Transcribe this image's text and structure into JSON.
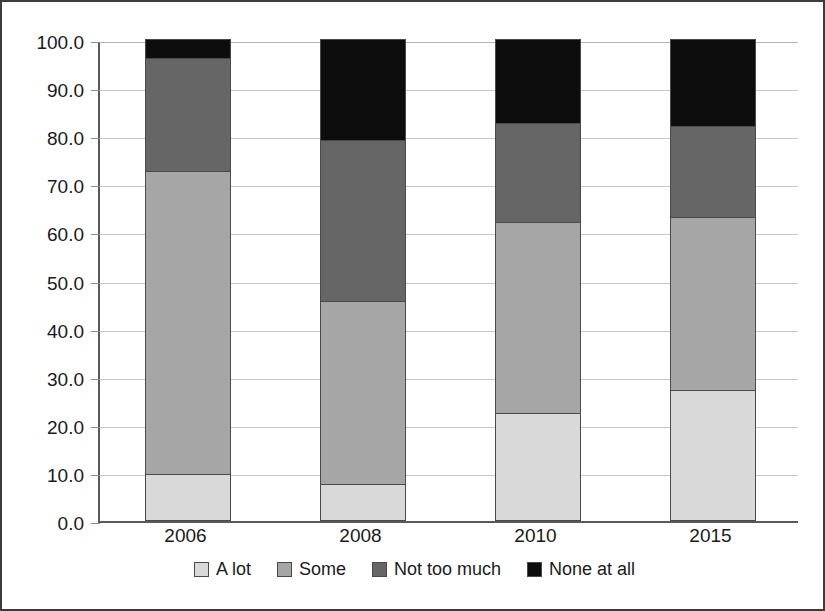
{
  "chart_data": {
    "type": "bar",
    "stacked": true,
    "stack_total": 100,
    "title": "",
    "subtitle": "",
    "xlabel": "",
    "ylabel": "",
    "categories": [
      "2006",
      "2008",
      "2010",
      "2015"
    ],
    "series": [
      {
        "name": "A lot",
        "color": "#d9d9d9",
        "values": [
          9.5,
          7.5,
          22.2,
          27.0
        ]
      },
      {
        "name": "Some",
        "color": "#a6a6a6",
        "values": [
          63.1,
          38.0,
          39.8,
          36.0
        ]
      },
      {
        "name": "Not too much",
        "color": "#666666",
        "values": [
          23.4,
          33.5,
          20.5,
          19.0
        ]
      },
      {
        "name": "None at all",
        "color": "#0d0d0d",
        "values": [
          4.0,
          21.0,
          17.5,
          18.0
        ]
      }
    ],
    "ylim": [
      0,
      100
    ],
    "ytick_values": [
      0,
      10,
      20,
      30,
      40,
      50,
      60,
      70,
      80,
      90,
      100
    ],
    "ytick_labels": [
      "0.0",
      "10.0",
      "20.0",
      "30.0",
      "40.0",
      "50.0",
      "60.0",
      "70.0",
      "80.0",
      "90.0",
      "100.0"
    ],
    "grid": true,
    "grid_axis": "y",
    "legend_position": "bottom",
    "bar_border_color": "#4a4a4a",
    "axis_color": "#595959",
    "grid_color": "#c8c8c8",
    "frame_color": "#3c3c3c",
    "background": "#ffffff"
  },
  "legend": {
    "items": [
      {
        "label": "A lot",
        "swatch_name": "legend-swatch-a-lot"
      },
      {
        "label": "Some",
        "swatch_name": "legend-swatch-some"
      },
      {
        "label": "Not too much",
        "swatch_name": "legend-swatch-not-too-much"
      },
      {
        "label": "None at all",
        "swatch_name": "legend-swatch-none-at-all"
      }
    ]
  }
}
